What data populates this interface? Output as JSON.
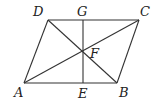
{
  "diagram": {
    "points": {
      "A": {
        "label": "A",
        "x": 24,
        "y": 83,
        "lx": 14,
        "ly": 97
      },
      "B": {
        "label": "B",
        "x": 117,
        "y": 83,
        "lx": 119,
        "ly": 97
      },
      "C": {
        "label": "C",
        "x": 139,
        "y": 20,
        "lx": 140,
        "ly": 16
      },
      "D": {
        "label": "D",
        "x": 48,
        "y": 20,
        "lx": 33,
        "ly": 16
      },
      "E": {
        "label": "E",
        "x": 83,
        "y": 83,
        "lx": 78,
        "ly": 98
      },
      "F": {
        "label": "F",
        "x": 83,
        "y": 52,
        "lx": 90,
        "ly": 58
      },
      "G": {
        "label": "G",
        "x": 83,
        "y": 20,
        "lx": 77,
        "ly": 16
      }
    },
    "segments": [
      [
        "A",
        "B"
      ],
      [
        "B",
        "C"
      ],
      [
        "C",
        "D"
      ],
      [
        "D",
        "A"
      ],
      [
        "A",
        "C"
      ],
      [
        "B",
        "D"
      ],
      [
        "G",
        "E"
      ]
    ],
    "line_color": "#333333"
  }
}
